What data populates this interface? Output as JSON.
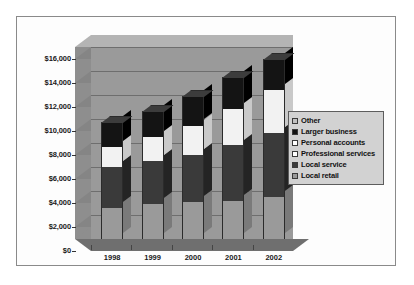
{
  "chart_data": {
    "type": "bar",
    "subtype": "stacked-3d-column",
    "title": "",
    "subtitle": "",
    "xlabel": "",
    "ylabel": "",
    "categories": [
      "1998",
      "1999",
      "2000",
      "2001",
      "2002"
    ],
    "ylim": [
      0,
      16000
    ],
    "ytick_values": [
      0,
      2000,
      4000,
      6000,
      8000,
      10000,
      12000,
      14000,
      16000
    ],
    "ytick_labels": [
      "$0",
      "$2,000",
      "$4,000",
      "$6,000",
      "$8,000",
      "$10,000",
      "$12,000",
      "$14,000",
      "$16,000"
    ],
    "grid": true,
    "legend_position": "right",
    "series": [
      {
        "name": "Local retail",
        "color": "#9a9a9a",
        "side_color": "#7a7a7a",
        "top_color": "#b6b6b6",
        "values": [
          2600,
          2950,
          3050,
          3150,
          3500
        ]
      },
      {
        "name": "Local service",
        "color": "#3a3a3a",
        "side_color": "#242424",
        "top_color": "#555555",
        "values": [
          3400,
          3550,
          3950,
          4650,
          5350
        ]
      },
      {
        "name": "Professional services",
        "color": "#f2f2f2",
        "side_color": "#c9c9c9",
        "top_color": "#ffffff",
        "values": [
          1700,
          2000,
          2450,
          3050,
          3550
        ]
      },
      {
        "name": "Personal accounts",
        "color": "#f2f2f2",
        "side_color": "#c9c9c9",
        "top_color": "#ffffff",
        "values": [
          0,
          0,
          0,
          0,
          0
        ]
      },
      {
        "name": "Larger business",
        "color": "#141414",
        "side_color": "#000000",
        "top_color": "#3c3c3c",
        "values": [
          2050,
          2150,
          2450,
          2650,
          2600
        ]
      },
      {
        "name": "Other",
        "color": "#c0c0c0",
        "side_color": "#9e9e9e",
        "top_color": "#d8d8d8",
        "values": [
          0,
          0,
          0,
          0,
          0
        ]
      }
    ],
    "totals": [
      9750,
      10650,
      11900,
      13500,
      15000
    ]
  },
  "legend": {
    "items": [
      {
        "label": "Other",
        "swatch": "#c0c0c0"
      },
      {
        "label": "Larger business",
        "swatch": "#141414"
      },
      {
        "label": "Personal accounts",
        "swatch": "#ffffff"
      },
      {
        "label": "Professional services",
        "swatch": "#ffffff"
      },
      {
        "label": "Local service",
        "swatch": "#3a3a3a"
      },
      {
        "label": "Local retail",
        "swatch": "#9a9a9a"
      }
    ]
  },
  "colors": {
    "plot_background": "#9a9a9a",
    "wall_top": "#b4b4b4",
    "wall_left": "#8e8e8e",
    "floor": "#6f6f6f",
    "gridline": "#6e6e6e",
    "frame_border": "#8a8a8a",
    "page_background": "#ffffff",
    "legend_background": "#d2d2d2",
    "text": "#111111"
  }
}
